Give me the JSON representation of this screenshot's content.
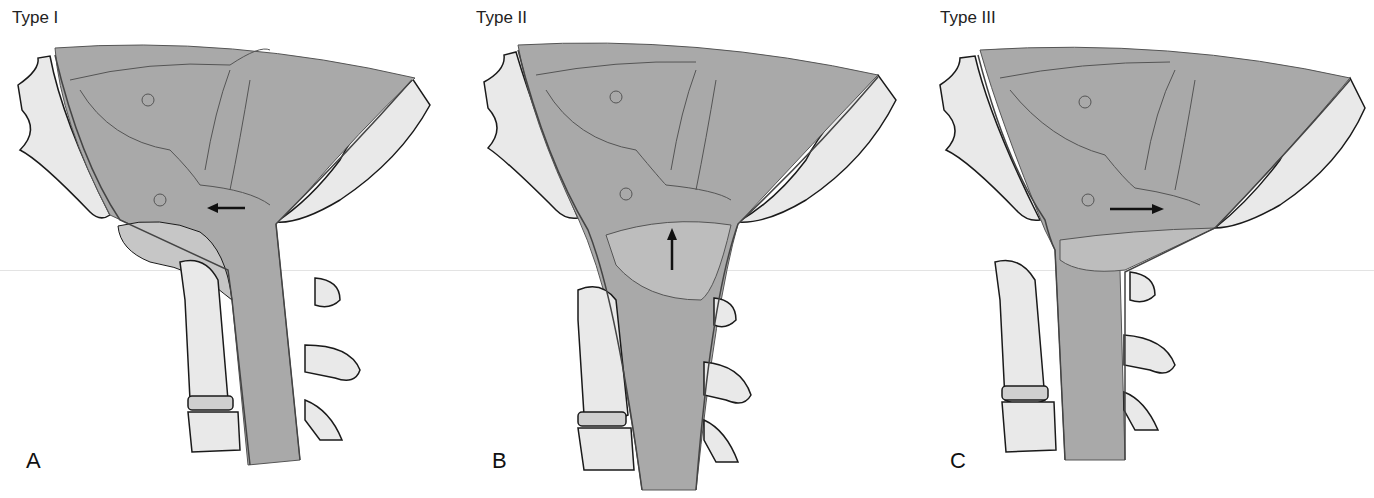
{
  "figure": {
    "panels": [
      {
        "title": "Type I",
        "letter": "A",
        "arrow_direction": "left"
      },
      {
        "title": "Type II",
        "letter": "B",
        "arrow_direction": "up"
      },
      {
        "title": "Type III",
        "letter": "C",
        "arrow_direction": "right"
      }
    ],
    "colors": {
      "brain": "#a9a9a9",
      "brain_light": "#bdbdbd",
      "bone": "#e9e9e9",
      "bone_pores": "#cfcfcf",
      "outline": "#1a1a1a",
      "arrow": "#111111"
    }
  }
}
